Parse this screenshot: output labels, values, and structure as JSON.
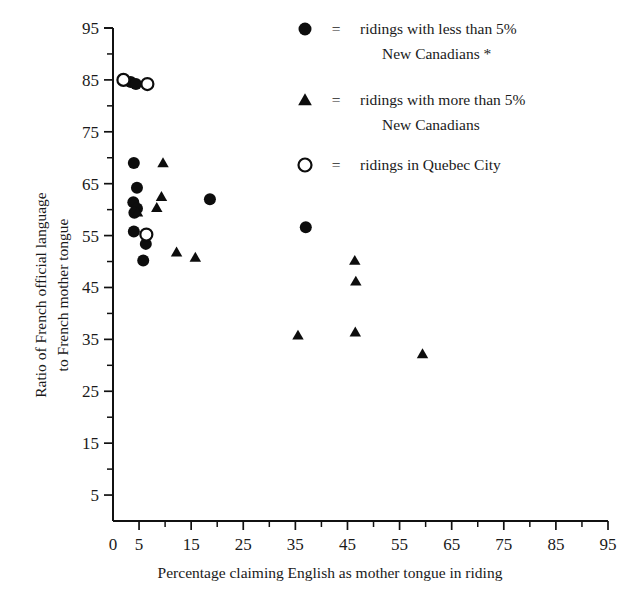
{
  "chart_data": {
    "type": "scatter",
    "title": "",
    "xlabel": "Percentage claiming English as mother tongue in riding",
    "ylabel_line1": "Ratio of French official language",
    "ylabel_line2": "to French mother tongue",
    "ylabel": "Ratio of French official language to French mother tongue",
    "xlim": [
      0,
      95
    ],
    "ylim": [
      0,
      95
    ],
    "grid": false,
    "x_ticks": [
      0,
      5,
      15,
      25,
      35,
      45,
      55,
      65,
      75,
      85,
      95
    ],
    "x_tick_labels": [
      "0",
      "5",
      "15",
      "25",
      "35",
      "45",
      "55",
      "65",
      "75",
      "85",
      "95"
    ],
    "x_minor_ticks": [
      10,
      20,
      30,
      40,
      50,
      60,
      70,
      80,
      90
    ],
    "y_ticks": [
      5,
      15,
      25,
      35,
      45,
      55,
      65,
      75,
      85,
      95
    ],
    "y_tick_labels": [
      "5",
      "15",
      "25",
      "35",
      "45",
      "55",
      "65",
      "75",
      "85",
      "95"
    ],
    "y_minor_ticks": [
      10,
      20,
      30,
      40,
      50,
      60,
      70,
      80,
      90
    ],
    "legend_position": "top-right",
    "series": [
      {
        "name": "ridings with less than 5% New Canadians *",
        "marker": "filled-circle",
        "color": "#0d0d0d",
        "points": [
          [
            3.4,
            84.6
          ],
          [
            4.4,
            84.2
          ],
          [
            4.0,
            69.0
          ],
          [
            4.6,
            64.2
          ],
          [
            3.9,
            61.4
          ],
          [
            4.6,
            60.2
          ],
          [
            4.1,
            59.4
          ],
          [
            4.0,
            55.8
          ],
          [
            6.3,
            53.4
          ],
          [
            5.8,
            50.2
          ],
          [
            18.6,
            62.0
          ],
          [
            37.0,
            56.6
          ]
        ]
      },
      {
        "name": "ridings with more than 5% New Canadians",
        "marker": "filled-triangle",
        "color": "#0d0d0d",
        "points": [
          [
            4.7,
            59.5
          ],
          [
            9.6,
            69.0
          ],
          [
            9.3,
            62.5
          ],
          [
            8.4,
            60.4
          ],
          [
            12.2,
            51.8
          ],
          [
            15.8,
            50.8
          ],
          [
            35.5,
            35.8
          ],
          [
            46.4,
            50.2
          ],
          [
            46.6,
            46.2
          ],
          [
            46.5,
            36.4
          ],
          [
            59.4,
            32.2
          ]
        ]
      },
      {
        "name": "ridings in Quebec City",
        "marker": "open-circle",
        "color": "#0d0d0d",
        "points": [
          [
            2.0,
            85.0
          ],
          [
            6.6,
            84.2
          ],
          [
            6.4,
            55.2
          ]
        ]
      }
    ]
  },
  "legend": {
    "equals": "=",
    "entries": [
      {
        "marker": "filled-circle",
        "line1": "ridings with less than 5%",
        "line2": "New Canadians *"
      },
      {
        "marker": "filled-triangle",
        "line1": "ridings with more than 5%",
        "line2": "New Canadians"
      },
      {
        "marker": "open-circle",
        "line1": "ridings in Quebec City",
        "line2": ""
      }
    ]
  }
}
